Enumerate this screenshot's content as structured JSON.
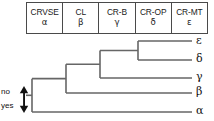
{
  "figure": {
    "type": "cladogram-with-character-table"
  },
  "table": {
    "columns": [
      {
        "code": "CRVSE",
        "greek": "α"
      },
      {
        "code": "CL",
        "greek": "β"
      },
      {
        "code": "CR-B",
        "greek": "γ"
      },
      {
        "code": "CR-OP",
        "greek": "δ"
      },
      {
        "code": "CR-MT",
        "greek": "ε"
      }
    ]
  },
  "tree": {
    "leaves": [
      {
        "label": "ε",
        "y": 41
      },
      {
        "label": "δ",
        "y": 60
      },
      {
        "label": "γ",
        "y": 78
      },
      {
        "label": "β",
        "y": 93
      },
      {
        "label": "α",
        "y": 112
      }
    ],
    "nodes": [
      {
        "name": "node-epsilon-delta",
        "x": 138,
        "y_top": 41,
        "y_bottom": 60
      },
      {
        "name": "node-epsilon-delta-gamma",
        "x": 100,
        "y_top": 50,
        "y_bottom": 78
      },
      {
        "name": "node-beta-clade",
        "x": 66,
        "y_top": 64,
        "y_bottom": 93
      },
      {
        "name": "node-root",
        "x": 32,
        "y_top": 78,
        "y_bottom": 112
      }
    ],
    "leaf_tip_x": 192,
    "root_stub_x": 26,
    "line_color": "#666666",
    "line_width": 1.6
  },
  "polarity": {
    "no_label": "no",
    "yes_label": "yes",
    "arrow_icon": "double-arrow-vertical-icon"
  }
}
